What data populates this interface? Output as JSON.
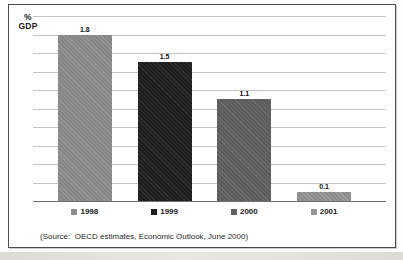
{
  "chart_data": {
    "type": "bar",
    "title": "",
    "xlabel": "",
    "ylabel": "% GDP",
    "ylabel_lines": [
      "%",
      "GDP"
    ],
    "categories": [
      "1998",
      "1999",
      "2000",
      "2001"
    ],
    "values": [
      1.8,
      1.5,
      1.1,
      0.1
    ],
    "data_labels": [
      "1.8",
      "1.5",
      "1.1",
      "0.1"
    ],
    "ylim": [
      0,
      2.0
    ],
    "grid_step": 0.2,
    "grid": true,
    "legend_position": "bottom",
    "bar_colors": [
      "#8d8d8d",
      "#1f1f1f",
      "#616161",
      "#949494"
    ],
    "gridline_color": "#c3c3c3",
    "baseline_color": "#6e6e6e",
    "source_note": "(Source:  OECD estimates, Economic Outlook, June 2000)"
  }
}
